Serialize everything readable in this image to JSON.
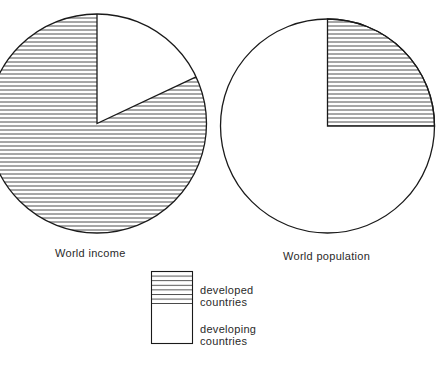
{
  "chart_data": [
    {
      "type": "pie",
      "title": "World income",
      "slices": [
        {
          "label": "developed countries",
          "value": 82,
          "pattern": "horizontal-hatch"
        },
        {
          "label": "developing countries",
          "value": 18,
          "pattern": "blank"
        }
      ],
      "start_angle": "12 o'clock, clockwise; developing slice first"
    },
    {
      "type": "pie",
      "title": "World population",
      "slices": [
        {
          "label": "developed countries",
          "value": 25,
          "pattern": "horizontal-hatch"
        },
        {
          "label": "developing countries",
          "value": 75,
          "pattern": "blank"
        }
      ],
      "start_angle": "12 o'clock, clockwise; developed slice first"
    }
  ],
  "labels": {
    "income": "World income",
    "population": "World population"
  },
  "legend": {
    "developed_line1": "developed",
    "developed_line2": "countries",
    "developing_line1": "developing",
    "developing_line2": "countries"
  },
  "colors": {
    "stroke": "#1a1a1a",
    "hatch": "#3a3a3a",
    "background": "#ffffff"
  }
}
